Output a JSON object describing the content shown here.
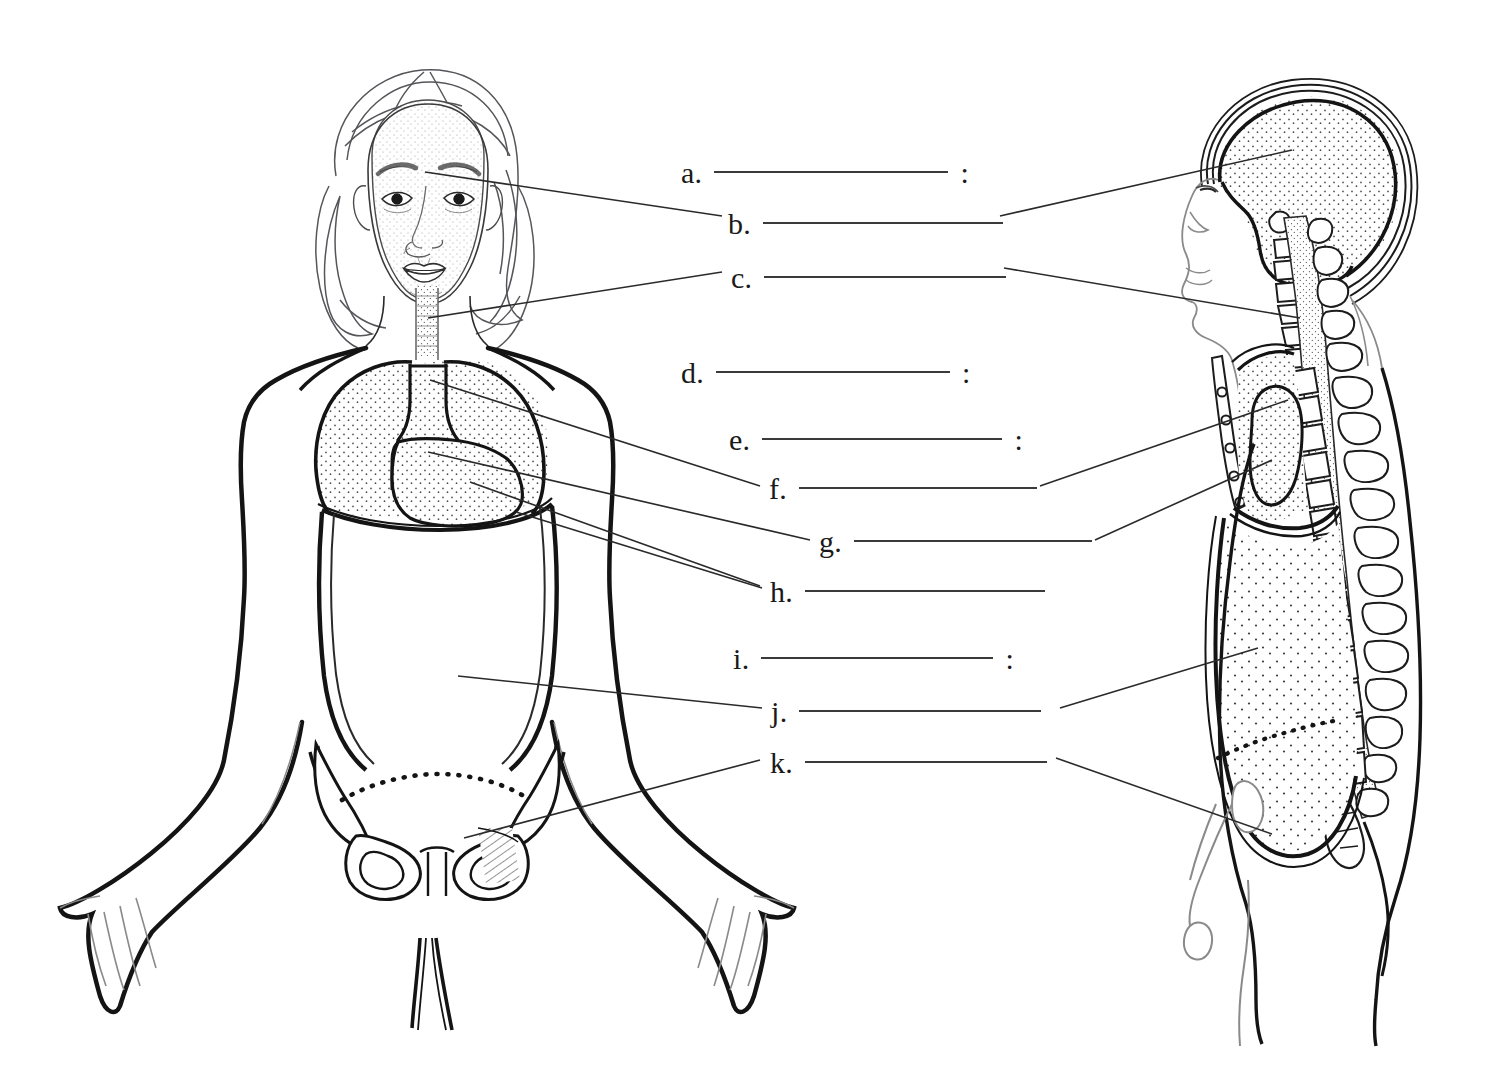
{
  "document": {
    "title": "Body Cavities Labeling Worksheet",
    "background_color": "#ffffff",
    "ink_color": "#1a1a1a",
    "width": 1506,
    "height": 1074
  },
  "labels": [
    {
      "letter": "a.",
      "colon": ":",
      "x": 681,
      "y": 158,
      "line_width": 234,
      "has_colon": true
    },
    {
      "letter": "b.",
      "colon": "",
      "x": 728,
      "y": 209,
      "line_width": 240,
      "has_colon": false
    },
    {
      "letter": "c.",
      "colon": "",
      "x": 731,
      "y": 263,
      "line_width": 242,
      "has_colon": false
    },
    {
      "letter": "d.",
      "colon": ":",
      "x": 681,
      "y": 358,
      "line_width": 234,
      "has_colon": true
    },
    {
      "letter": "e.",
      "colon": ":",
      "x": 729,
      "y": 425,
      "line_width": 240,
      "has_colon": true
    },
    {
      "letter": "f.",
      "colon": "",
      "x": 769,
      "y": 474,
      "line_width": 238,
      "has_colon": false
    },
    {
      "letter": "g.",
      "colon": "",
      "x": 819,
      "y": 527,
      "line_width": 238,
      "has_colon": false
    },
    {
      "letter": "h.",
      "colon": "",
      "x": 770,
      "y": 577,
      "line_width": 240,
      "has_colon": false
    },
    {
      "letter": "i.",
      "colon": ":",
      "x": 733,
      "y": 644,
      "line_width": 232,
      "has_colon": true
    },
    {
      "letter": "j.",
      "colon": "",
      "x": 771,
      "y": 697,
      "line_width": 242,
      "has_colon": false
    },
    {
      "letter": "k.",
      "colon": "",
      "x": 770,
      "y": 748,
      "line_width": 242,
      "has_colon": false
    }
  ],
  "figures": {
    "anterior": {
      "name": "anterior-body-view",
      "description": "Front view of a female figure showing outlined body cavities"
    },
    "lateral": {
      "name": "lateral-body-view",
      "description": "Side view of a figure showing cranial, vertebral, thoracic, abdominal and pelvic cavities"
    }
  },
  "leader_lines": {
    "description": "Thin pointer lines connecting each blank to a structure on the anatomical drawings"
  }
}
